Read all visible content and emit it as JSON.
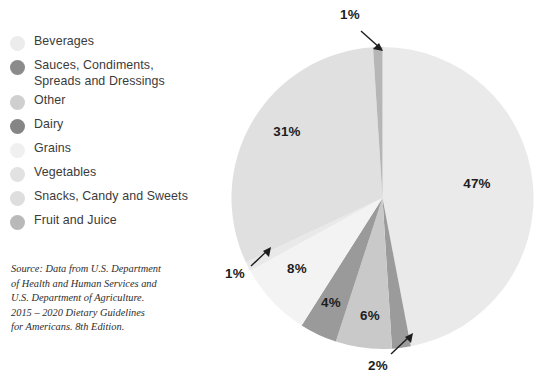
{
  "chart_data": {
    "type": "pie",
    "title": "",
    "subtitle": "",
    "xlabel": "",
    "ylabel": "",
    "legend_position": "left",
    "grid": false,
    "units": "percent",
    "categories": [
      "Beverages",
      "Sauces, Condiments,\nSpreads and Dressings",
      "Other",
      "Dairy",
      "Grains",
      "Vegetables",
      "Snacks, Candy and Sweets",
      "Fruit and Juice"
    ],
    "values": [
      47,
      2,
      6,
      4,
      8,
      1,
      31,
      1
    ],
    "value_labels": [
      "47%",
      "2%",
      "6%",
      "4%",
      "8%",
      "1%",
      "31%",
      "1%"
    ],
    "colors": [
      "#eaeaea",
      "#9b9b9b",
      "#c9c9c9",
      "#9a9a9a",
      "#f3f3f3",
      "#e9e9e9",
      "#e0e0e0",
      "#b6b6b6"
    ],
    "start_angle_deg": 0,
    "direction": "clockwise",
    "callout_slices": [
      "Fruit and Juice",
      "Vegetables",
      "Sauces, Condiments, Spreads and Dressings"
    ]
  },
  "legend": {
    "items": [
      {
        "label": "Beverages",
        "color": "#ececec",
        "value_label": "47%"
      },
      {
        "label": "Sauces, Condiments,\nSpreads and Dressings",
        "color": "#8b8b8b",
        "value_label": "2%"
      },
      {
        "label": "Other",
        "color": "#cfcfcf",
        "value_label": "6%"
      },
      {
        "label": "Dairy",
        "color": "#858585",
        "value_label": "4%"
      },
      {
        "label": "Grains",
        "color": "#f0f0f0",
        "value_label": "8%"
      },
      {
        "label": "Vegetables",
        "color": "#e2e2e2",
        "value_label": "1%"
      },
      {
        "label": "Snacks, Candy and Sweets",
        "color": "#dedede",
        "value_label": "31%"
      },
      {
        "label": "Fruit and Juice",
        "color": "#b9b9b9",
        "value_label": "1%"
      }
    ]
  },
  "source_note": {
    "text": "Source: Data from U.S. Department\nof Health and Human Services and\nU.S. Department of Agriculture.\n2015 – 2020 Dietary Guidelines\nfor Americans. 8th Edition."
  },
  "chart_labels": {
    "beverages": "47%",
    "snacks": "31%",
    "grains": "8%",
    "other": "6%",
    "dairy": "4%",
    "sauces": "2%",
    "vegetables": "1%",
    "fruit": "1%"
  },
  "theme": {
    "background": "#ffffff",
    "text": "#3b3b3b",
    "label_text": "#1d1d1d",
    "source_text": "#2e2e2e",
    "callout": "#1d1d1d"
  }
}
